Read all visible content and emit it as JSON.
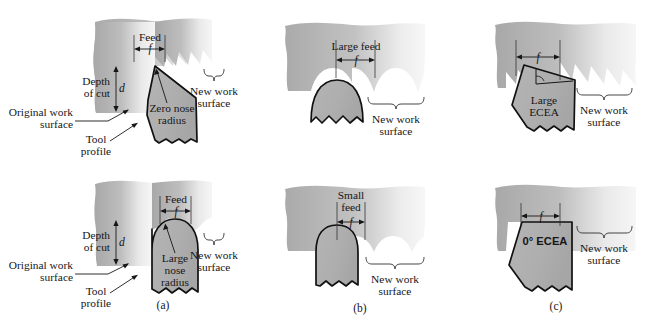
{
  "figure": {
    "background": "#ffffff",
    "work_fill_light": "#f2f2f2",
    "work_fill_dark": "#a9a9a9",
    "tool_fill": "#b0b0b0",
    "outline_color": "#111111"
  },
  "captions": {
    "a": "(a)",
    "b": "(b)",
    "c": "(c)"
  },
  "panels": [
    {
      "id": "top-left",
      "column": "a",
      "row": "top",
      "feed_label": "Feed",
      "feed_symbol": "f",
      "depth_label_line1": "Depth",
      "depth_label_line2": "of cut",
      "depth_symbol": "d",
      "original_surface_line1": "Original work",
      "original_surface_line2": "surface",
      "tool_profile_line1": "Tool",
      "tool_profile_line2": "profile",
      "tool_callout_line1": "Zero nose",
      "tool_callout_line2": "radius",
      "new_surface_line1": "New work",
      "new_surface_line2": "surface",
      "surface_pattern": "sawtooth"
    },
    {
      "id": "bottom-left",
      "column": "a",
      "row": "bottom",
      "feed_label": "Feed",
      "feed_symbol": "f",
      "depth_label_line1": "Depth",
      "depth_label_line2": "of cut",
      "depth_symbol": "d",
      "original_surface_line1": "Original work",
      "original_surface_line2": "surface",
      "tool_profile_line1": "Tool",
      "tool_profile_line2": "profile",
      "tool_callout_line1": "Large",
      "tool_callout_line2": "nose",
      "tool_callout_line3": "radius",
      "new_surface_line1": "New work",
      "new_surface_line2": "surface",
      "surface_pattern": "shallow-scallop"
    },
    {
      "id": "top-middle",
      "column": "b",
      "row": "top",
      "feed_label": "Large feed",
      "feed_symbol": "f",
      "new_surface_line1": "New work",
      "new_surface_line2": "surface",
      "surface_pattern": "deep-scallop"
    },
    {
      "id": "bottom-middle",
      "column": "b",
      "row": "bottom",
      "feed_label_line1": "Small",
      "feed_label_line2": "feed",
      "feed_symbol": "f",
      "new_surface_line1": "New work",
      "new_surface_line2": "surface",
      "surface_pattern": "shallow-scallop"
    },
    {
      "id": "top-right",
      "column": "c",
      "row": "top",
      "feed_symbol": "f",
      "tool_callout_line1": "Large",
      "tool_callout_line2": "ECEA",
      "new_surface_line1": "New work",
      "new_surface_line2": "surface",
      "surface_pattern": "angled-sawtooth"
    },
    {
      "id": "bottom-right",
      "column": "c",
      "row": "bottom",
      "feed_symbol": "f",
      "tool_callout_line1": "0° ECEA",
      "new_surface_line1": "New work",
      "new_surface_line2": "surface",
      "surface_pattern": "flat"
    }
  ]
}
